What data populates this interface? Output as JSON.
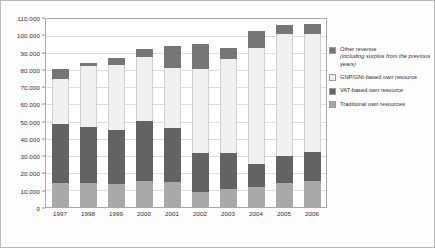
{
  "chart_data": {
    "type": "bar",
    "stacked": true,
    "title": "",
    "xlabel": "",
    "ylabel": "",
    "ylim": [
      0,
      110000
    ],
    "ytick_labels": [
      "110.000",
      "100.000",
      "90.000",
      "80.000",
      "70.000",
      "60.000",
      "50.000",
      "40.000",
      "30.000",
      "20.000",
      "10.000",
      "0"
    ],
    "ytick_values": [
      110000,
      100000,
      90000,
      80000,
      70000,
      60000,
      50000,
      40000,
      30000,
      20000,
      10000,
      0
    ],
    "grid": true,
    "legend_position": "right",
    "categories": [
      "1997",
      "1998",
      "1999",
      "2000",
      "2001",
      "2002",
      "2003",
      "2004",
      "2005",
      "2006"
    ],
    "series": [
      {
        "name": "Traditional own resources",
        "color": "#a9a9a9",
        "values": [
          14000,
          14000,
          13500,
          15000,
          14500,
          9000,
          10500,
          12000,
          14000,
          15000
        ]
      },
      {
        "name": "VAT-based own resource",
        "color": "#636363",
        "values": [
          34500,
          33000,
          31500,
          35500,
          31500,
          22500,
          21000,
          13000,
          16000,
          17000
        ]
      },
      {
        "name": "GNP/GNI-based own resource",
        "color": "#f0f0f0",
        "values": [
          26500,
          35500,
          38000,
          37500,
          35500,
          49500,
          55000,
          68000,
          71000,
          69500
        ]
      },
      {
        "name": "Other revenue (including surplus from the previous years)",
        "color": "#767676",
        "values": [
          5500,
          2000,
          4000,
          4500,
          13000,
          14500,
          6500,
          10000,
          5500,
          5500
        ]
      }
    ],
    "totals": [
      80500,
      84500,
      87000,
      92500,
      94500,
      95500,
      93000,
      103000,
      106500,
      107000
    ]
  },
  "legend": {
    "entries": [
      {
        "label": "Other revenue",
        "sublabel": "(including surplus from the previous years)",
        "swatch": "other-revenue-swatch"
      },
      {
        "label": "GNP/GNI-based own resource",
        "sublabel": "",
        "swatch": "gnp-gni-swatch"
      },
      {
        "label": "VAT-based own resource",
        "sublabel": "",
        "swatch": "vat-swatch"
      },
      {
        "label": "Traditional own resources",
        "sublabel": "",
        "swatch": "traditional-swatch"
      }
    ]
  }
}
